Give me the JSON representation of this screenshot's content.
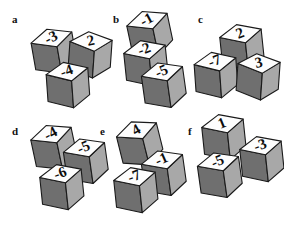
{
  "figure": {
    "type": "cube-number-puzzle",
    "background_color": "#ffffff",
    "cube_colors": {
      "top_face": "#fdfdfd",
      "left_face": "#6f6f6f",
      "right_face": "#a8a8a8",
      "outline": "#1a1a1a",
      "number": "#0d0d0d"
    },
    "groups": [
      {
        "label": "a",
        "label_x": 12,
        "label_y": 14,
        "cubes": [
          {
            "value": "-3",
            "x": 30,
            "y": 26,
            "rotate": -10
          },
          {
            "value": "2",
            "x": 66,
            "y": 30,
            "rotate": 4
          },
          {
            "value": "-4",
            "x": 44,
            "y": 60,
            "rotate": -4
          }
        ]
      },
      {
        "label": "b",
        "label_x": 113,
        "label_y": 14,
        "cubes": [
          {
            "value": "-1",
            "x": 126,
            "y": 8,
            "rotate": -12
          },
          {
            "value": "-2",
            "x": 122,
            "y": 38,
            "rotate": -6
          },
          {
            "value": "-5",
            "x": 140,
            "y": 60,
            "rotate": -8
          }
        ]
      },
      {
        "label": "c",
        "label_x": 198,
        "label_y": 14,
        "cubes": [
          {
            "value": "2",
            "x": 218,
            "y": 22,
            "rotate": -6
          },
          {
            "value": "-7",
            "x": 192,
            "y": 50,
            "rotate": -4
          },
          {
            "value": "3",
            "x": 234,
            "y": 52,
            "rotate": 4
          }
        ]
      },
      {
        "label": "d",
        "label_x": 12,
        "label_y": 126,
        "cubes": [
          {
            "value": "-4",
            "x": 30,
            "y": 122,
            "rotate": -12
          },
          {
            "value": "-5",
            "x": 62,
            "y": 136,
            "rotate": -8
          },
          {
            "value": "-6",
            "x": 38,
            "y": 162,
            "rotate": -6
          }
        ]
      },
      {
        "label": "e",
        "label_x": 100,
        "label_y": 126,
        "cubes": [
          {
            "value": "4",
            "x": 116,
            "y": 118,
            "rotate": -14
          },
          {
            "value": "-1",
            "x": 140,
            "y": 148,
            "rotate": -8
          },
          {
            "value": "-7",
            "x": 112,
            "y": 165,
            "rotate": -6
          }
        ]
      },
      {
        "label": "f",
        "label_x": 188,
        "label_y": 126,
        "cubes": [
          {
            "value": "1",
            "x": 200,
            "y": 112,
            "rotate": -6
          },
          {
            "value": "-3",
            "x": 238,
            "y": 134,
            "rotate": -6
          },
          {
            "value": "-5",
            "x": 196,
            "y": 150,
            "rotate": -8
          }
        ]
      }
    ]
  }
}
